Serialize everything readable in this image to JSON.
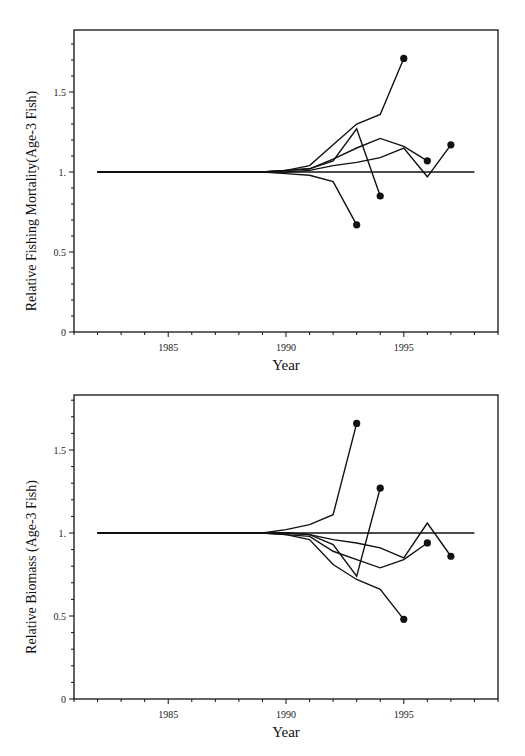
{
  "chart_data": [
    {
      "type": "line",
      "title": "",
      "xlabel": "Year",
      "ylabel": "Relative Fishing Mortality(Age-3 Fish)",
      "xlim": [
        1981,
        1999
      ],
      "ylim": [
        0,
        1.89
      ],
      "x_ticks": [
        1985,
        1990,
        1995
      ],
      "y_ticks": [
        0,
        0.5,
        1.0,
        1.5
      ],
      "y_tick_labels": [
        "0",
        "0.5",
        "1.",
        "1.5"
      ],
      "grid": false,
      "legend": null,
      "baseline": {
        "name": "reference",
        "x": [
          1982,
          1998
        ],
        "values": [
          1.0,
          1.0
        ]
      },
      "series": [
        {
          "name": "retrospective-1995",
          "x": [
            1982,
            1989,
            1990,
            1991,
            1992,
            1993,
            1994,
            1995
          ],
          "values": [
            1.0,
            1.0,
            1.01,
            1.04,
            1.17,
            1.3,
            1.36,
            1.71
          ],
          "end_marker": true
        },
        {
          "name": "retrospective-1994",
          "x": [
            1982,
            1989,
            1990,
            1991,
            1992,
            1993,
            1994
          ],
          "values": [
            1.0,
            1.0,
            1.01,
            1.02,
            1.07,
            1.27,
            0.85
          ],
          "end_marker": true
        },
        {
          "name": "retrospective-1996",
          "x": [
            1982,
            1989,
            1990,
            1991,
            1992,
            1993,
            1994,
            1995,
            1996
          ],
          "values": [
            1.0,
            1.0,
            1.01,
            1.02,
            1.08,
            1.15,
            1.21,
            1.16,
            1.07
          ],
          "end_marker": true
        },
        {
          "name": "retrospective-1997",
          "x": [
            1982,
            1989,
            1990,
            1991,
            1992,
            1993,
            1994,
            1995,
            1996,
            1997
          ],
          "values": [
            1.0,
            1.0,
            1.0,
            1.01,
            1.04,
            1.06,
            1.09,
            1.15,
            0.97,
            1.17
          ],
          "end_marker": true
        },
        {
          "name": "retrospective-1993",
          "x": [
            1982,
            1989,
            1990,
            1991,
            1992,
            1993
          ],
          "values": [
            1.0,
            1.0,
            0.99,
            0.98,
            0.94,
            0.67
          ],
          "end_marker": true
        }
      ]
    },
    {
      "type": "line",
      "title": "",
      "xlabel": "Year",
      "ylabel": "Relative Biomass (Age-3 Fish)",
      "xlim": [
        1981,
        1999
      ],
      "ylim": [
        0,
        1.83
      ],
      "x_ticks": [
        1985,
        1990,
        1995
      ],
      "y_ticks": [
        0,
        0.5,
        1.0,
        1.5
      ],
      "y_tick_labels": [
        "0",
        "0.5",
        "1.",
        "1.5"
      ],
      "grid": false,
      "legend": null,
      "baseline": {
        "name": "reference",
        "x": [
          1982,
          1998
        ],
        "values": [
          1.0,
          1.0
        ]
      },
      "series": [
        {
          "name": "retrospective-1993",
          "x": [
            1982,
            1989,
            1990,
            1991,
            1992,
            1993
          ],
          "values": [
            1.0,
            1.0,
            1.02,
            1.05,
            1.11,
            1.66
          ],
          "end_marker": true
        },
        {
          "name": "retrospective-1994",
          "x": [
            1982,
            1989,
            1990,
            1991,
            1992,
            1993,
            1994
          ],
          "values": [
            1.0,
            1.0,
            1.0,
            0.99,
            0.93,
            0.74,
            1.27
          ],
          "end_marker": true
        },
        {
          "name": "retrospective-1995",
          "x": [
            1982,
            1989,
            1990,
            1991,
            1992,
            1993,
            1994,
            1995
          ],
          "values": [
            1.0,
            1.0,
            0.99,
            0.96,
            0.81,
            0.72,
            0.66,
            0.48
          ],
          "end_marker": true
        },
        {
          "name": "retrospective-1996",
          "x": [
            1982,
            1989,
            1990,
            1991,
            1992,
            1993,
            1994,
            1995,
            1996
          ],
          "values": [
            1.0,
            1.0,
            0.99,
            0.98,
            0.89,
            0.84,
            0.79,
            0.84,
            0.94
          ],
          "end_marker": true
        },
        {
          "name": "retrospective-1997",
          "x": [
            1982,
            1989,
            1990,
            1991,
            1992,
            1993,
            1994,
            1995,
            1996,
            1997
          ],
          "values": [
            1.0,
            1.0,
            1.0,
            0.99,
            0.96,
            0.94,
            0.91,
            0.85,
            1.06,
            0.86
          ],
          "end_marker": true
        }
      ]
    }
  ],
  "layout": [
    {
      "frame": {
        "left": 74,
        "top": 30,
        "right": 498,
        "bottom": 332
      },
      "y_zero_px": 332,
      "y_px_per_unit": 160
    },
    {
      "frame": {
        "left": 74,
        "top": 395,
        "right": 498,
        "bottom": 699
      },
      "y_zero_px": 699,
      "y_px_per_unit": 166
    }
  ],
  "colors": {
    "line": "#111111",
    "background": "#ffffff"
  }
}
